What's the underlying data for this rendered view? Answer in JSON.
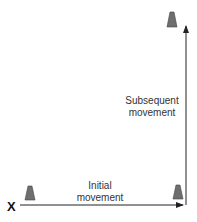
{
  "diagram": {
    "start_marker": "X",
    "labels": {
      "initial": [
        "Initial",
        "movement"
      ],
      "subsequent": [
        "Subsequent",
        "movement"
      ]
    },
    "elements": {
      "cones": [
        "cone-start",
        "cone-corner",
        "cone-top"
      ],
      "arrows": [
        "initial-movement-arrow",
        "subsequent-movement-arrow"
      ]
    },
    "colors": {
      "cone": "#6e6e6e",
      "line": "#222222",
      "text": "#333333"
    }
  }
}
